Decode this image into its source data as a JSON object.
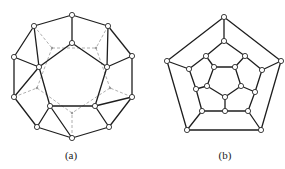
{
  "figures": [
    {
      "id": "a",
      "caption": "(a)",
      "caption_pos": [
        71,
        149
      ],
      "description": "Dodecahedron drawn with outer decagon and inner pentagon; hidden back edges dashed",
      "nodes": [
        [
          72,
          15
        ],
        [
          108,
          26
        ],
        [
          132,
          56
        ],
        [
          132,
          97
        ],
        [
          109,
          127
        ],
        [
          72,
          138
        ],
        [
          37,
          127
        ],
        [
          14,
          97
        ],
        [
          14,
          57
        ],
        [
          34,
          26
        ],
        [
          72,
          43
        ],
        [
          107,
          67
        ],
        [
          95,
          106
        ],
        [
          50,
          106
        ],
        [
          39,
          67
        ]
      ],
      "edges": [
        [
          0,
          1
        ],
        [
          1,
          2
        ],
        [
          2,
          3
        ],
        [
          3,
          4
        ],
        [
          4,
          5
        ],
        [
          5,
          6
        ],
        [
          6,
          7
        ],
        [
          7,
          8
        ],
        [
          8,
          9
        ],
        [
          9,
          0
        ],
        [
          10,
          11
        ],
        [
          11,
          12
        ],
        [
          12,
          13
        ],
        [
          13,
          14
        ],
        [
          14,
          10
        ],
        [
          0,
          10
        ],
        [
          2,
          11
        ],
        [
          4,
          12
        ],
        [
          6,
          13
        ],
        [
          8,
          14
        ],
        [
          9,
          14
        ],
        [
          1,
          11
        ],
        [
          3,
          12
        ],
        [
          5,
          13
        ],
        [
          7,
          14
        ]
      ],
      "hidden_nodes": [
        [
          52,
          48
        ],
        [
          96,
          48
        ],
        [
          110,
          88
        ],
        [
          72,
          113
        ],
        [
          37,
          88
        ]
      ],
      "hidden_edges": [
        [
          [
            34,
            26
          ],
          [
            52,
            48
          ]
        ],
        [
          [
            108,
            26
          ],
          [
            96,
            48
          ]
        ],
        [
          [
            132,
            97
          ],
          [
            110,
            88
          ]
        ],
        [
          [
            72,
            138
          ],
          [
            72,
            113
          ]
        ],
        [
          [
            14,
            97
          ],
          [
            37,
            88
          ]
        ],
        [
          [
            52,
            48
          ],
          [
            96,
            48
          ]
        ],
        [
          [
            96,
            48
          ],
          [
            110,
            88
          ]
        ],
        [
          [
            110,
            88
          ],
          [
            72,
            113
          ]
        ],
        [
          [
            72,
            113
          ],
          [
            37,
            88
          ]
        ],
        [
          [
            37,
            88
          ],
          [
            52,
            48
          ]
        ]
      ]
    },
    {
      "id": "b",
      "caption": "(b)",
      "caption_pos": [
        225,
        149
      ],
      "description": "Schlegel diagram of the dodecahedron",
      "nodes": [
        [
          224,
          17
        ],
        [
          281,
          61
        ],
        [
          261,
          130
        ],
        [
          187,
          130
        ],
        [
          167,
          61
        ],
        [
          224,
          41
        ],
        [
          245,
          56
        ],
        [
          262,
          70
        ],
        [
          255,
          92
        ],
        [
          248,
          111
        ],
        [
          225,
          111
        ],
        [
          202,
          111
        ],
        [
          196,
          89
        ],
        [
          189,
          69
        ],
        [
          206,
          56
        ],
        [
          214,
          67
        ],
        [
          235,
          67
        ],
        [
          241,
          86
        ],
        [
          225,
          97
        ],
        [
          207,
          86
        ]
      ],
      "edges": [
        [
          0,
          1
        ],
        [
          1,
          2
        ],
        [
          2,
          3
        ],
        [
          3,
          4
        ],
        [
          4,
          0
        ],
        [
          0,
          5
        ],
        [
          1,
          7
        ],
        [
          2,
          9
        ],
        [
          3,
          11
        ],
        [
          4,
          13
        ],
        [
          5,
          6
        ],
        [
          6,
          7
        ],
        [
          7,
          8
        ],
        [
          8,
          9
        ],
        [
          9,
          10
        ],
        [
          10,
          11
        ],
        [
          11,
          12
        ],
        [
          12,
          13
        ],
        [
          13,
          14
        ],
        [
          14,
          5
        ],
        [
          14,
          15
        ],
        [
          6,
          16
        ],
        [
          8,
          17
        ],
        [
          10,
          18
        ],
        [
          12,
          19
        ],
        [
          15,
          16
        ],
        [
          16,
          17
        ],
        [
          17,
          18
        ],
        [
          18,
          19
        ],
        [
          19,
          15
        ]
      ]
    }
  ]
}
